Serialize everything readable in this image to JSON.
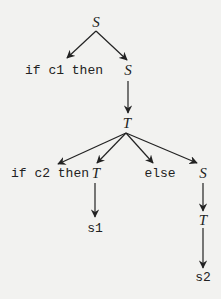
{
  "diagram": {
    "type": "parse-tree",
    "colors": {
      "background": "#f2f2f0",
      "ink": "#222222"
    },
    "nodes": {
      "root_s": {
        "label": "S",
        "kind": "nonterminal"
      },
      "if_c1_then": {
        "label": "if c1 then",
        "kind": "terminal"
      },
      "s_inner": {
        "label": "S",
        "kind": "nonterminal"
      },
      "t_mid": {
        "label": "T",
        "kind": "nonterminal"
      },
      "if_c2_then": {
        "label": "if c2 then",
        "kind": "terminal"
      },
      "t_left": {
        "label": "T",
        "kind": "nonterminal"
      },
      "else": {
        "label": "else",
        "kind": "terminal"
      },
      "s_right": {
        "label": "S",
        "kind": "nonterminal"
      },
      "s1": {
        "label": "s1",
        "kind": "terminal"
      },
      "t_right": {
        "label": "T",
        "kind": "nonterminal"
      },
      "s2": {
        "label": "s2",
        "kind": "terminal"
      }
    },
    "edges": [
      {
        "from": "root_s",
        "to": "if_c1_then"
      },
      {
        "from": "root_s",
        "to": "s_inner"
      },
      {
        "from": "s_inner",
        "to": "t_mid"
      },
      {
        "from": "t_mid",
        "to": "if_c2_then"
      },
      {
        "from": "t_mid",
        "to": "t_left"
      },
      {
        "from": "t_mid",
        "to": "else"
      },
      {
        "from": "t_mid",
        "to": "s_right"
      },
      {
        "from": "t_left",
        "to": "s1"
      },
      {
        "from": "s_right",
        "to": "t_right"
      },
      {
        "from": "t_right",
        "to": "s2"
      }
    ]
  }
}
